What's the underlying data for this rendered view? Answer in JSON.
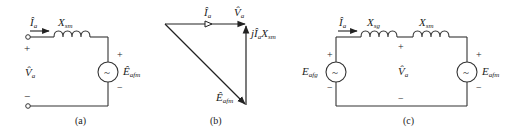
{
  "figure": {
    "panels": [
      {
        "id": "a",
        "caption": "(a)",
        "current": {
          "symbol": "Î",
          "sub": "a"
        },
        "reactance": {
          "symbol": "X",
          "sub": "sm"
        },
        "terminal_voltage": {
          "symbol": "V̂",
          "sub": "a"
        },
        "source": {
          "symbol": "Ê",
          "sub": "afm",
          "glyph": "~"
        },
        "plus": "+",
        "minus": "−"
      },
      {
        "id": "b",
        "caption": "(b)",
        "phasors": {
          "current": {
            "symbol": "Î",
            "sub": "a"
          },
          "voltage": {
            "symbol": "V̂",
            "sub": "a"
          },
          "drop": {
            "prefix": "jÎ",
            "sub1": "a",
            "mid": "X",
            "sub2": "sm"
          },
          "emf": {
            "symbol": "Ê",
            "sub": "afm"
          }
        }
      },
      {
        "id": "c",
        "caption": "(c)",
        "current": {
          "symbol": "Î",
          "sub": "a"
        },
        "reactance_g": {
          "symbol": "X",
          "sub": "sg"
        },
        "reactance_m": {
          "symbol": "X",
          "sub": "sm"
        },
        "source_g": {
          "symbol": "E",
          "sub": "afg",
          "glyph": "~"
        },
        "source_m": {
          "symbol": "E",
          "sub": "afm",
          "glyph": "~"
        },
        "terminal_voltage": {
          "symbol": "V̂",
          "sub": "a"
        },
        "plus": "+",
        "minus": "−"
      }
    ]
  }
}
